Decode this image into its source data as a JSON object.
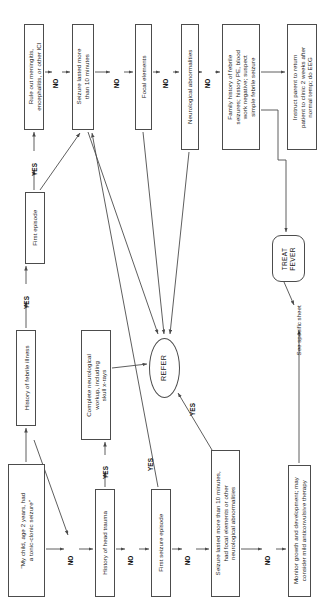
{
  "diagram": {
    "orientation": "rotated-90-ccw",
    "stroke_color": "#4c4c4c",
    "text_color": "#1a1a1a",
    "background": "#ffffff"
  },
  "nodes": [
    {
      "id": "start",
      "shape": "rect",
      "text": "\"My child, age 2 years, had\na tonic-clonic seizure\"",
      "x": 8,
      "y": 464,
      "w": 37,
      "h": 133
    },
    {
      "id": "hx_febrile_illness",
      "shape": "rect",
      "text": "History of febrile illness",
      "x": 16,
      "y": 330,
      "w": 20,
      "h": 96
    },
    {
      "id": "first_episode",
      "shape": "rect",
      "text": "First episode",
      "x": 25,
      "y": 192,
      "w": 20,
      "h": 72
    },
    {
      "id": "rule_out",
      "shape": "rect",
      "text": "Rule out meningitis,\nencephalitis, or other ICI",
      "x": 24,
      "y": 24,
      "w": 20,
      "h": 106
    },
    {
      "id": "hx_head_trauma",
      "shape": "rect",
      "text": "History of head trauma",
      "x": 95,
      "y": 489,
      "w": 20,
      "h": 108
    },
    {
      "id": "complete_workup",
      "shape": "rect",
      "text": "Complete neurological\nworkup, including\nskull x-rays",
      "x": 81,
      "y": 330,
      "w": 30,
      "h": 110
    },
    {
      "id": "seizure_10_min",
      "shape": "rect",
      "text": "Seizure lasted more\nthan 10 minutes",
      "x": 72,
      "y": 24,
      "w": 22,
      "h": 106
    },
    {
      "id": "first_seizure_episode",
      "shape": "rect",
      "text": "First seizure episode",
      "x": 151,
      "y": 489,
      "w": 20,
      "h": 108
    },
    {
      "id": "refer",
      "shape": "ellipse",
      "text": "REFER",
      "x": 149,
      "y": 338,
      "w": 31,
      "h": 60
    },
    {
      "id": "focal_elements",
      "shape": "rect",
      "text": "Focal elements",
      "x": 135,
      "y": 24,
      "w": 17,
      "h": 106
    },
    {
      "id": "seizure_focal_neuro",
      "shape": "rect",
      "text": "Seizure lasted more than 10 minutes,\nhad focal elements or other\nneurological abnormalities",
      "x": 211,
      "y": 450,
      "w": 29,
      "h": 147
    },
    {
      "id": "neuro_abnormalities",
      "shape": "rect",
      "text": "Neurological abnormalities",
      "x": 181,
      "y": 24,
      "w": 18,
      "h": 126
    },
    {
      "id": "family_history",
      "shape": "rect",
      "text": "Family history of febrile\nseizures; history PE, blood\nwork negative; suspect\nsimple febrile seizure",
      "x": 222,
      "y": 24,
      "w": 38,
      "h": 126
    },
    {
      "id": "monitor_growth",
      "shape": "rect",
      "text": "Monitor growth and development; may\nconsider mild anticonvulsive therapy",
      "x": 288,
      "y": 465,
      "w": 23,
      "h": 132
    },
    {
      "id": "treat_fever",
      "shape": "terminator",
      "text": "TREAT\nFEVER",
      "x": 272,
      "y": 235,
      "w": 33,
      "h": 47
    },
    {
      "id": "instruct_parent",
      "shape": "rect",
      "text": "Instruct parent to return\npatient to clinic 2 weeks after\nnormal temp; do EEG",
      "x": 287,
      "y": 24,
      "w": 30,
      "h": 126
    }
  ],
  "edge_labels": [
    {
      "id": "no_start",
      "text": "NO",
      "x": 71,
      "y": 549
    },
    {
      "id": "yes_febrile",
      "text": "YES",
      "x": 24,
      "y": 288
    },
    {
      "id": "yes_first_ep",
      "text": "YES",
      "x": 32,
      "y": 155
    },
    {
      "id": "no_rule_out",
      "text": "NO",
      "x": 56,
      "y": 72
    },
    {
      "id": "no_head_trauma",
      "text": "NO",
      "x": 131,
      "y": 549
    },
    {
      "id": "yes_head_trauma",
      "text": "YES",
      "x": 97,
      "y": 460
    },
    {
      "id": "yes_first_ep_2",
      "text": "YES",
      "x": 148,
      "y": 450
    },
    {
      "id": "no_first_seiz",
      "text": "NO",
      "x": 188,
      "y": 549
    },
    {
      "id": "yes_refer",
      "text": "YES",
      "x": 190,
      "y": 395
    },
    {
      "id": "no_focal",
      "text": "NO",
      "x": 117,
      "y": 72
    },
    {
      "id": "no_neuro",
      "text": "NO",
      "x": 166,
      "y": 72
    },
    {
      "id": "no_family",
      "text": "NO",
      "x": 208,
      "y": 72
    },
    {
      "id": "no_seizure_row",
      "text": "NO",
      "x": 268,
      "y": 549
    }
  ],
  "plain_labels": [
    {
      "id": "see_specific_sheet",
      "text": "See specific sheet",
      "x": 290,
      "y": 310
    }
  ],
  "edges": [
    {
      "from": "start",
      "to": "hx_febrile_illness",
      "kind": "arrow"
    },
    {
      "from": "start",
      "to": "no_start",
      "kind": "arrow-diagonal"
    },
    {
      "from": "hx_febrile_illness",
      "to": "first_episode",
      "kind": "arrow"
    },
    {
      "from": "first_episode",
      "to": "rule_out",
      "kind": "arrow"
    },
    {
      "from": "first_episode",
      "to": "seizure_10_min",
      "kind": "arrow-diagonal"
    },
    {
      "from": "rule_out",
      "to": "seizure_10_min",
      "kind": "arrow"
    },
    {
      "from": "hx_head_trauma",
      "to": "complete_workup",
      "kind": "arrow"
    },
    {
      "from": "hx_head_trauma",
      "to": "first_seizure_episode",
      "kind": "arrow"
    },
    {
      "from": "complete_workup",
      "to": "refer",
      "kind": "arrow"
    },
    {
      "from": "first_seizure_episode",
      "to": "seizure_focal_neuro",
      "kind": "arrow"
    },
    {
      "from": "first_seizure_episode",
      "to": "seizure_10_min",
      "kind": "arrow-diagonal"
    },
    {
      "from": "seizure_10_min",
      "to": "focal_elements",
      "kind": "arrow"
    },
    {
      "from": "seizure_10_min",
      "to": "refer",
      "kind": "arrow-diagonal"
    },
    {
      "from": "focal_elements",
      "to": "neuro_abnormalities",
      "kind": "arrow"
    },
    {
      "from": "focal_elements",
      "to": "refer",
      "kind": "arrow-diagonal"
    },
    {
      "from": "neuro_abnormalities",
      "to": "family_history",
      "kind": "arrow"
    },
    {
      "from": "neuro_abnormalities",
      "to": "refer",
      "kind": "arrow-diagonal"
    },
    {
      "from": "seizure_focal_neuro",
      "to": "refer",
      "kind": "arrow-diagonal"
    },
    {
      "from": "seizure_focal_neuro",
      "to": "monitor_growth",
      "kind": "arrow"
    },
    {
      "from": "family_history",
      "to": "instruct_parent",
      "kind": "arrow"
    },
    {
      "from": "family_history",
      "to": "treat_fever",
      "kind": "arrow"
    },
    {
      "from": "treat_fever",
      "to": "see_specific_sheet",
      "kind": "arrow"
    },
    {
      "from": "monitor_growth",
      "to": "see_specific_sheet",
      "kind": "arrow"
    }
  ]
}
